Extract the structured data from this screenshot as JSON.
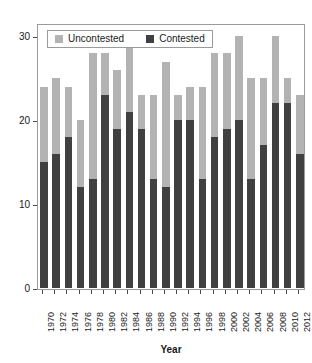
{
  "chart_data": {
    "type": "bar",
    "stacked": true,
    "title": "",
    "xlabel": "Year",
    "ylabel": "",
    "grid": false,
    "legend_position": "top-left",
    "ylim": [
      0,
      31
    ],
    "yticks": [
      0,
      10,
      20,
      30
    ],
    "categories": [
      "1970",
      "1972",
      "1974",
      "1976",
      "1978",
      "1980",
      "1982",
      "1984",
      "1986",
      "1988",
      "1990",
      "1992",
      "1994",
      "1996",
      "1998",
      "2000",
      "2002",
      "2004",
      "2006",
      "2008",
      "2010",
      "2012"
    ],
    "series": [
      {
        "name": "Contested",
        "color": "#404040",
        "values": [
          15,
          16,
          18,
          12,
          13,
          23,
          19,
          21,
          19,
          13,
          12,
          20,
          20,
          13,
          18,
          19,
          20,
          13,
          17,
          22,
          22,
          16
        ]
      },
      {
        "name": "Uncontested",
        "color": "#b3b3b3",
        "values": [
          9,
          9,
          6,
          8,
          15,
          5,
          7,
          8,
          4,
          10,
          15,
          3,
          4,
          11,
          10,
          9,
          10,
          12,
          8,
          8,
          3,
          7
        ]
      }
    ],
    "totals": [
      24,
      25,
      24,
      20,
      28,
      28,
      26,
      29,
      23,
      23,
      27,
      23,
      24,
      24,
      28,
      28,
      30,
      25,
      25,
      30,
      25,
      23
    ]
  },
  "legend": {
    "entries": [
      {
        "label": "Uncontested",
        "swatch": "legend-swatch-uncontested"
      },
      {
        "label": "Contested",
        "swatch": "legend-swatch-contested"
      }
    ]
  },
  "axes": {
    "x_title": "Year",
    "y_tick_labels": [
      "0",
      "10",
      "20",
      "30"
    ],
    "x_tick_labels": [
      "1970",
      "1972",
      "1974",
      "1976",
      "1978",
      "1980",
      "1982",
      "1984",
      "1986",
      "1988",
      "1990",
      "1992",
      "1994",
      "1996",
      "1998",
      "2000",
      "2002",
      "2004",
      "2006",
      "2008",
      "2010",
      "2012"
    ]
  },
  "colors": {
    "uncontested": "#b3b3b3",
    "contested": "#404040",
    "frame": "#9a9a9a",
    "text": "#1a1a1a",
    "background": "#ffffff"
  }
}
